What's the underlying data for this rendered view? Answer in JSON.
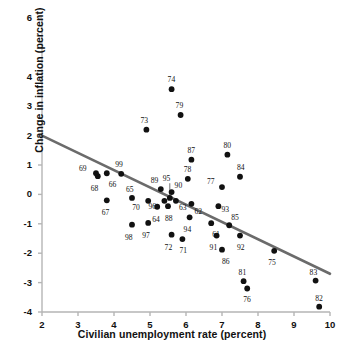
{
  "chart_data": {
    "type": "scatter",
    "title": "",
    "xlabel": "Civilian unemployment rate (percent)",
    "ylabel": "Change in inflation (percent)",
    "xlim": [
      2,
      10
    ],
    "ylim": [
      -4,
      6
    ],
    "xticks": [
      "2",
      "3",
      "4",
      "5",
      "6",
      "7",
      "8",
      "9",
      "10"
    ],
    "yticks": [
      "6",
      "4",
      "3",
      "2",
      "1",
      "0",
      "-1",
      "-2",
      "-3",
      "-4"
    ],
    "ytick_values": [
      6,
      5,
      4,
      3,
      2,
      1,
      0,
      -1,
      -2,
      -3,
      -4
    ],
    "grid": false,
    "legend": null,
    "point_color": "#111111",
    "line_color": "#6b6b6b",
    "axis_color": "#b5b5b5",
    "trendline": {
      "type": "line",
      "x": [
        2,
        10
      ],
      "y": [
        2.0,
        -2.7
      ]
    },
    "points": [
      {
        "label": "61",
        "x": 6.7,
        "y": -0.98,
        "lx": 5,
        "ly": 12
      },
      {
        "label": "62",
        "x": 6.15,
        "y": -0.32,
        "lx": 7,
        "ly": 8
      },
      {
        "label": "63",
        "x": 5.72,
        "y": -0.22,
        "lx": 7,
        "ly": 7
      },
      {
        "label": "64",
        "x": 5.2,
        "y": -0.42,
        "lx": -1,
        "ly": 13
      },
      {
        "label": "65",
        "x": 4.5,
        "y": -0.12,
        "lx": -2,
        "ly": -8
      },
      {
        "label": "66",
        "x": 3.8,
        "y": 0.72,
        "lx": 6,
        "ly": 12
      },
      {
        "label": "67",
        "x": 3.8,
        "y": -0.2,
        "lx": -1,
        "ly": 13
      },
      {
        "label": "68",
        "x": 3.55,
        "y": 0.62,
        "lx": -3,
        "ly": 13
      },
      {
        "label": "69",
        "x": 3.5,
        "y": 0.72,
        "lx": -13,
        "ly": -4
      },
      {
        "label": "70",
        "x": 4.95,
        "y": -0.22,
        "lx": -12,
        "ly": 7
      },
      {
        "label": "71",
        "x": 5.9,
        "y": -1.52,
        "lx": 1,
        "ly": 12
      },
      {
        "label": "72",
        "x": 5.6,
        "y": -1.37,
        "lx": -3,
        "ly": 13
      },
      {
        "label": "73",
        "x": 4.9,
        "y": 2.2,
        "lx": -2,
        "ly": -9
      },
      {
        "label": "74",
        "x": 5.6,
        "y": 3.58,
        "lx": 0,
        "ly": -9
      },
      {
        "label": "75",
        "x": 8.45,
        "y": -1.92,
        "lx": -2,
        "ly": 12
      },
      {
        "label": "76",
        "x": 7.7,
        "y": -3.2,
        "lx": 0,
        "ly": 12
      },
      {
        "label": "77",
        "x": 7.0,
        "y": 0.25,
        "lx": -11,
        "ly": -5
      },
      {
        "label": "78",
        "x": 6.05,
        "y": 0.53,
        "lx": 0,
        "ly": -9
      },
      {
        "label": "79",
        "x": 5.85,
        "y": 2.7,
        "lx": -1,
        "ly": -9
      },
      {
        "label": "80",
        "x": 7.15,
        "y": 1.35,
        "lx": 0,
        "ly": -9
      },
      {
        "label": "81",
        "x": 7.6,
        "y": -2.95,
        "lx": -1,
        "ly": -8
      },
      {
        "label": "82",
        "x": 9.7,
        "y": -3.82,
        "lx": 0,
        "ly": -8
      },
      {
        "label": "83",
        "x": 9.6,
        "y": -2.93,
        "lx": -2,
        "ly": -8
      },
      {
        "label": "84",
        "x": 7.5,
        "y": 0.6,
        "lx": 1,
        "ly": -9
      },
      {
        "label": "85",
        "x": 7.2,
        "y": -1.05,
        "lx": 6,
        "ly": -7
      },
      {
        "label": "86",
        "x": 7.0,
        "y": -1.88,
        "lx": 4,
        "ly": 12
      },
      {
        "label": "87",
        "x": 6.15,
        "y": 1.18,
        "lx": 0,
        "ly": -9
      },
      {
        "label": "88",
        "x": 5.5,
        "y": -0.4,
        "lx": 1,
        "ly": 13
      },
      {
        "label": "89",
        "x": 5.3,
        "y": 0.18,
        "lx": -6,
        "ly": -8
      },
      {
        "label": "90",
        "x": 5.6,
        "y": 0.08,
        "lx": 7,
        "ly": -6
      },
      {
        "label": "91",
        "x": 6.85,
        "y": -1.4,
        "lx": -3,
        "ly": 12
      },
      {
        "label": "92",
        "x": 7.5,
        "y": -1.4,
        "lx": 1,
        "ly": 12
      },
      {
        "label": "93",
        "x": 6.9,
        "y": -0.4,
        "lx": 7,
        "ly": 4
      },
      {
        "label": "94",
        "x": 6.1,
        "y": -0.78,
        "lx": -2,
        "ly": 13
      },
      {
        "label": "95",
        "x": 5.55,
        "y": -0.12,
        "lx": -3,
        "ly": -19
      },
      {
        "label": "96",
        "x": 5.4,
        "y": -0.22,
        "lx": -12,
        "ly": 6
      },
      {
        "label": "97",
        "x": 4.95,
        "y": -0.97,
        "lx": -2,
        "ly": 13
      },
      {
        "label": "98",
        "x": 4.5,
        "y": -1.03,
        "lx": -3,
        "ly": 13
      },
      {
        "label": "99",
        "x": 4.2,
        "y": 0.7,
        "lx": -2,
        "ly": -9
      }
    ],
    "leader_lines": [
      {
        "label": "95",
        "from_x": 5.55,
        "from_y": 0.38,
        "to_x": 5.55,
        "to_y": -0.05
      }
    ]
  }
}
